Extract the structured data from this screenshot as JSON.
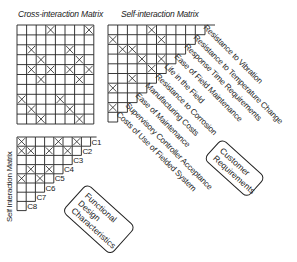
{
  "titles": {
    "cross": "Cross-interaction Matrix",
    "self_top": "Self-interaction Matrix",
    "self_left": "Self Interaction Matrix"
  },
  "customer_requirements": [
    "Resistance to Vibration",
    "Resistance to Temperature Change",
    "Response Time Requirements",
    "Ease of Field Maintenance",
    "Life in the Field",
    "Resistance to Corrosion",
    "Manufacturing Costs",
    "Ease of Maintenance",
    "Supervisory Controller Acceptance",
    "Costs of Use of Fielded System"
  ],
  "design_characteristics": [
    "C1",
    "C2",
    "C3",
    "C4",
    "C5",
    "C6",
    "C7",
    "C8"
  ],
  "boxes": {
    "customer": "Customer Requirements",
    "functional": "Functional Design Characteristics"
  },
  "cross_matrix": {
    "rows": 10,
    "cols": 8,
    "marks": [
      [
        1,
        4
      ],
      [
        1,
        8
      ],
      [
        3,
        2
      ],
      [
        3,
        6
      ],
      [
        4,
        3
      ],
      [
        4,
        7
      ],
      [
        5,
        2
      ],
      [
        5,
        4
      ],
      [
        5,
        6
      ],
      [
        5,
        8
      ],
      [
        6,
        3
      ],
      [
        6,
        7
      ],
      [
        8,
        1
      ],
      [
        8,
        5
      ],
      [
        9,
        2
      ],
      [
        9,
        6
      ],
      [
        10,
        3
      ],
      [
        10,
        7
      ]
    ]
  },
  "self_top_matrix": {
    "rows": 10,
    "marks": [
      [
        1,
        5
      ],
      [
        2,
        1
      ],
      [
        2,
        6
      ],
      [
        3,
        2
      ],
      [
        3,
        3
      ],
      [
        4,
        4
      ],
      [
        4,
        6
      ],
      [
        5,
        5
      ],
      [
        6,
        3
      ],
      [
        7,
        1
      ],
      [
        9,
        1
      ]
    ]
  },
  "self_left_matrix": {
    "rows": 8,
    "marks": [
      [
        1,
        1
      ],
      [
        1,
        5
      ],
      [
        1,
        7
      ],
      [
        2,
        1
      ],
      [
        2,
        2
      ],
      [
        2,
        4
      ],
      [
        2,
        6
      ],
      [
        4,
        2
      ],
      [
        4,
        4
      ],
      [
        5,
        1
      ],
      [
        5,
        3
      ]
    ]
  }
}
